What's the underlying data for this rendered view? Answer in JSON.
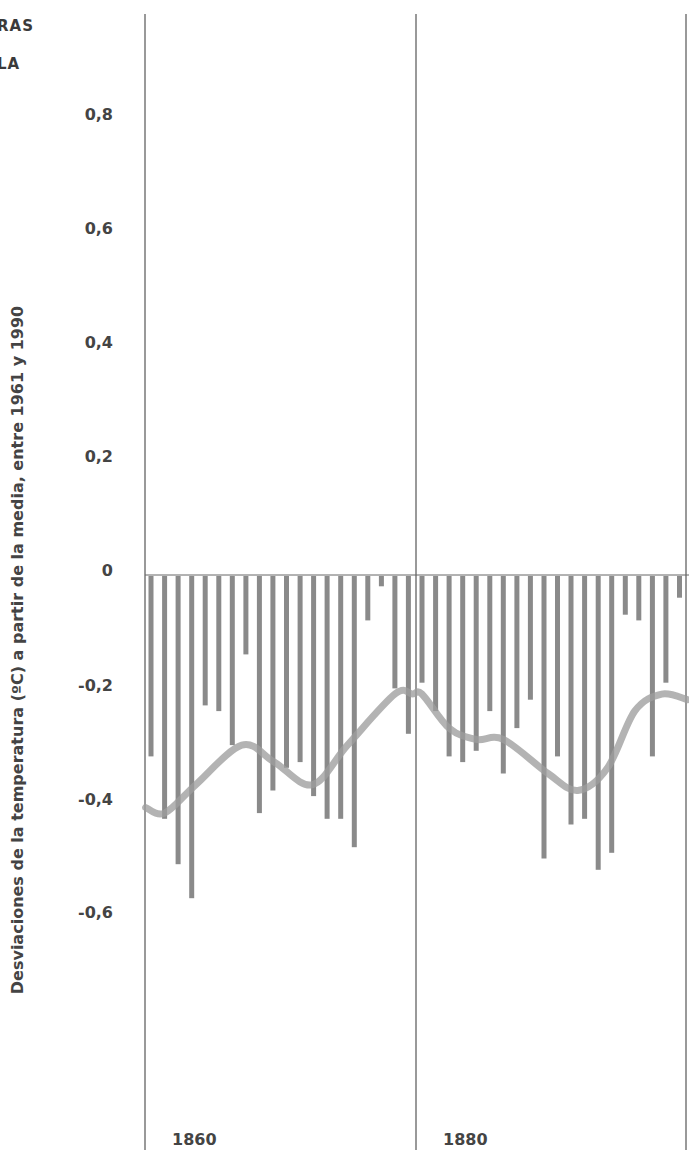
{
  "header": {
    "corner_line_1": "RAS",
    "corner_line_2": "LA"
  },
  "axes": {
    "ylabel": "Desviaciones de la temperatura (ºC) a partir de la media, entre 1961 y 1990",
    "yticks": [
      "0,8",
      "0,6",
      "0,4",
      "0,2",
      "0",
      "-0,2",
      "-0,4",
      "-0,6"
    ],
    "xticks": [
      "1860",
      "1880"
    ]
  },
  "colors": {
    "bars": "#8a8a8a",
    "curve": "#9e9e9e",
    "gridlines": "#555555"
  },
  "chart_data": {
    "type": "bar",
    "title": "",
    "xlabel": "",
    "ylabel": "Desviaciones de la temperatura (ºC) a partir de la media, entre 1961 y 1990",
    "ylim": [
      -0.9,
      0.9
    ],
    "grid": "vertical lines at 1860 and 1880",
    "categories": [
      1860,
      1861,
      1862,
      1863,
      1864,
      1865,
      1866,
      1867,
      1868,
      1869,
      1870,
      1871,
      1872,
      1873,
      1874,
      1875,
      1876,
      1877,
      1878,
      1879,
      1880,
      1881,
      1882,
      1883,
      1884,
      1885,
      1886,
      1887,
      1888,
      1889,
      1890,
      1891,
      1892,
      1893,
      1894,
      1895,
      1896,
      1897,
      1898,
      1899
    ],
    "series": [
      {
        "name": "Annual anomaly",
        "type": "bar",
        "values": [
          -0.32,
          -0.43,
          -0.51,
          -0.57,
          -0.23,
          -0.24,
          -0.3,
          -0.14,
          -0.42,
          -0.38,
          -0.34,
          -0.33,
          -0.39,
          -0.43,
          -0.43,
          -0.48,
          -0.08,
          -0.02,
          -0.2,
          -0.28,
          -0.19,
          -0.24,
          -0.32,
          -0.33,
          -0.31,
          -0.24,
          -0.35,
          -0.27,
          -0.22,
          -0.5,
          -0.32,
          -0.44,
          -0.43,
          -0.52,
          -0.49,
          -0.07,
          -0.08,
          -0.32,
          -0.19,
          -0.04
        ]
      },
      {
        "name": "Smoothed trend",
        "type": "line",
        "x": [
          1859.6,
          1861.0,
          1863.3,
          1866.7,
          1869.1,
          1871.9,
          1874.5,
          1878.0,
          1879.3,
          1880.0,
          1882.0,
          1884.0,
          1886.0,
          1889.3,
          1891.5,
          1893.7,
          1895.7,
          1897.7,
          1899.6
        ],
        "values": [
          -0.41,
          -0.42,
          -0.37,
          -0.3,
          -0.33,
          -0.37,
          -0.3,
          -0.21,
          -0.21,
          -0.21,
          -0.27,
          -0.29,
          -0.29,
          -0.35,
          -0.38,
          -0.34,
          -0.24,
          -0.21,
          -0.22
        ]
      }
    ]
  }
}
